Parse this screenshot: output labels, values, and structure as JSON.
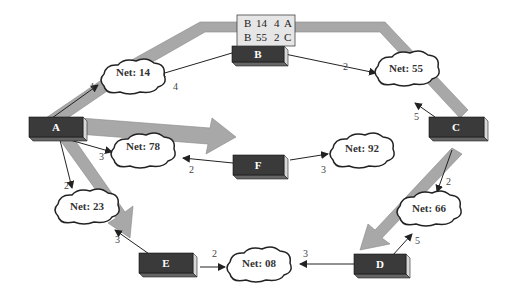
{
  "colors": {
    "router_face": "#3a3a3a",
    "router_side": "#d8d8d8",
    "band": "#a8a8a8",
    "band_stroke": "#888888",
    "cloud_fill": "#ffffff",
    "cloud_stroke": "#222222",
    "table_bg": "#e6e6e6",
    "arrow": "#222222"
  },
  "routing_table": {
    "rows": [
      [
        "B",
        "14",
        "4",
        "A"
      ],
      [
        "B",
        "55",
        "2",
        "C"
      ]
    ]
  },
  "routers": {
    "A": {
      "label": "A"
    },
    "B": {
      "label": "B"
    },
    "C": {
      "label": "C"
    },
    "D": {
      "label": "D"
    },
    "E": {
      "label": "E"
    },
    "F": {
      "label": "F"
    }
  },
  "networks": {
    "n14": {
      "label": "Net: 14"
    },
    "n55": {
      "label": "Net: 55"
    },
    "n78": {
      "label": "Net: 78"
    },
    "n92": {
      "label": "Net: 92"
    },
    "n23": {
      "label": "Net: 23"
    },
    "n66": {
      "label": "Net: 66"
    },
    "n08": {
      "label": "Net: 08"
    }
  },
  "links": {
    "A_n14": "1",
    "B_n14": "4",
    "B_n55": "2",
    "C_n55": "5",
    "A_n78": "3",
    "F_n78": "2",
    "F_n92": "3",
    "A_n23": "2",
    "E_n23": "3",
    "C_n66": "2",
    "D_n66": "5",
    "E_n08": "2",
    "D_n08": "3"
  }
}
